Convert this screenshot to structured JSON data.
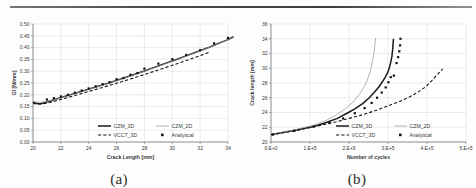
{
  "figure": {
    "subfigure_labels": [
      "(a)",
      "(b)"
    ]
  },
  "legend": {
    "entries": [
      {
        "label": "CZM_3D",
        "style": "solid-bold"
      },
      {
        "label": "CZM_2D",
        "style": "solid-thin-gray"
      },
      {
        "label": "VCCT_3D",
        "style": "dashed"
      },
      {
        "label": "Analytical",
        "style": "square-marker"
      }
    ]
  },
  "chart_data": [
    {
      "type": "line",
      "panel": "(a)",
      "title": "",
      "xlabel": "Crack Length [mm]",
      "ylabel": "GI [N/mm]",
      "xlim": [
        20,
        34
      ],
      "ylim": [
        0.0,
        0.5
      ],
      "xticks": [
        20,
        22,
        24,
        26,
        28,
        30,
        32,
        34
      ],
      "yticks": [
        0.0,
        0.05,
        0.1,
        0.15,
        0.2,
        0.25,
        0.3,
        0.35,
        0.4,
        0.45,
        0.5
      ],
      "ytick_labels": [
        "0.00",
        "0.05",
        "0.10",
        "0.15",
        "0.20",
        "0.25",
        "0.30",
        "0.35",
        "0.40",
        "0.45",
        "0.50"
      ],
      "xtick_labels": [
        "20",
        "22",
        "24",
        "26",
        "28",
        "30",
        "32",
        "34"
      ],
      "grid": true,
      "legend_position": "inside-bottom-right",
      "series": [
        {
          "name": "CZM_3D",
          "x": [
            20.0,
            20.2,
            20.4,
            20.6,
            20.8,
            21.0,
            21.3,
            21.6,
            22.0,
            22.5,
            23.0,
            23.5,
            24.0,
            24.5,
            25.0,
            25.5,
            26.0,
            26.5,
            27.0,
            27.5,
            28.0,
            28.5,
            29.0,
            29.5,
            30.0,
            30.5,
            31.0,
            31.5,
            32.0,
            32.5,
            33.0,
            33.5,
            34.0,
            34.4
          ],
          "y": [
            0.17,
            0.164,
            0.162,
            0.163,
            0.166,
            0.17,
            0.175,
            0.181,
            0.188,
            0.197,
            0.206,
            0.215,
            0.224,
            0.233,
            0.242,
            0.251,
            0.261,
            0.271,
            0.281,
            0.291,
            0.301,
            0.312,
            0.322,
            0.333,
            0.343,
            0.354,
            0.365,
            0.376,
            0.387,
            0.398,
            0.41,
            0.422,
            0.434,
            0.446
          ]
        },
        {
          "name": "CZM_2D",
          "x": [
            20.0,
            20.5,
            21.0,
            21.5,
            22.0,
            23.0,
            24.0,
            25.0,
            26.0,
            27.0,
            28.0,
            29.0,
            30.0,
            31.0,
            32.0,
            33.0,
            34.0,
            34.4
          ],
          "y": [
            0.172,
            0.168,
            0.172,
            0.179,
            0.187,
            0.205,
            0.223,
            0.241,
            0.26,
            0.28,
            0.3,
            0.321,
            0.342,
            0.364,
            0.386,
            0.409,
            0.433,
            0.444
          ]
        },
        {
          "name": "VCCT_3D",
          "x": [
            20.0,
            20.5,
            21.0,
            21.5,
            22.0,
            23.0,
            24.0,
            25.0,
            26.0,
            27.0,
            28.0,
            29.0,
            30.0,
            31.0,
            32.0,
            32.6
          ],
          "y": [
            0.163,
            0.16,
            0.165,
            0.172,
            0.18,
            0.197,
            0.214,
            0.231,
            0.249,
            0.267,
            0.286,
            0.305,
            0.325,
            0.345,
            0.366,
            0.379
          ]
        },
        {
          "name": "Analytical",
          "marker": "square",
          "x": [
            21.0,
            21.5,
            22.0,
            22.5,
            23.0,
            23.5,
            24.0,
            24.5,
            25.0,
            25.5,
            26.0,
            26.5,
            27.0,
            27.5,
            28.0,
            29.0,
            30.0,
            31.0,
            32.0,
            33.0,
            34.0
          ],
          "y": [
            0.18,
            0.186,
            0.193,
            0.2,
            0.209,
            0.218,
            0.227,
            0.236,
            0.245,
            0.253,
            0.266,
            0.271,
            0.285,
            0.292,
            0.311,
            0.332,
            0.351,
            0.369,
            0.389,
            0.418,
            0.441
          ]
        }
      ]
    },
    {
      "type": "line",
      "panel": "(b)",
      "title": "",
      "xlabel": "Number of cycles",
      "ylabel": "Crack length [mm]",
      "xlim": [
        0,
        500000
      ],
      "ylim": [
        20,
        36
      ],
      "xticks": [
        0,
        100000,
        200000,
        300000,
        400000,
        500000
      ],
      "xtick_labels": [
        "0.E+0",
        "1.E+5",
        "2.E+5",
        "3.E+5",
        "4.E+5",
        "5.E+5"
      ],
      "yticks": [
        20,
        22,
        24,
        26,
        28,
        30,
        32,
        34,
        36
      ],
      "ytick_labels": [
        "20",
        "22",
        "24",
        "26",
        "28",
        "30",
        "32",
        "34",
        "36"
      ],
      "grid": true,
      "legend_position": "inside-bottom-right",
      "series": [
        {
          "name": "CZM_3D",
          "x": [
            0,
            20000,
            50000,
            80000,
            110000,
            140000,
            170000,
            195000,
            215000,
            235000,
            252000,
            266000,
            277000,
            286000,
            293000,
            299000,
            303000,
            307000,
            310000,
            312000,
            314000
          ],
          "y": [
            21.0,
            21.2,
            21.5,
            21.8,
            22.1,
            22.6,
            23.2,
            23.9,
            24.5,
            25.2,
            26.0,
            26.8,
            27.5,
            28.2,
            28.8,
            29.4,
            30.0,
            30.8,
            31.6,
            32.6,
            34.0
          ]
        },
        {
          "name": "CZM_2D",
          "x": [
            0,
            20000,
            50000,
            80000,
            110000,
            140000,
            165000,
            188000,
            208000,
            224000,
            237000,
            247000,
            254000,
            259000,
            263000,
            265000,
            267000,
            268000
          ],
          "y": [
            21.0,
            21.2,
            21.5,
            21.9,
            22.3,
            22.9,
            23.6,
            24.4,
            25.3,
            26.3,
            27.3,
            28.4,
            29.5,
            30.6,
            31.8,
            32.6,
            33.4,
            34.1
          ]
        },
        {
          "name": "VCCT_3D",
          "x": [
            0,
            25000,
            60000,
            95000,
            130000,
            165000,
            200000,
            235000,
            270000,
            300000,
            330000,
            355000,
            378000,
            397000,
            412000,
            424000,
            433000,
            440000
          ],
          "y": [
            21.0,
            21.2,
            21.5,
            21.9,
            22.3,
            22.7,
            23.2,
            23.7,
            24.3,
            24.9,
            25.5,
            26.1,
            26.8,
            27.5,
            28.3,
            29.0,
            29.5,
            29.9
          ]
        },
        {
          "name": "Analytical",
          "marker": "square",
          "x": [
            5000,
            60000,
            110000,
            150000,
            185000,
            215000,
            240000,
            258000,
            272000,
            284000,
            294000,
            301000,
            307000,
            315000,
            322000,
            326000,
            329000,
            331000,
            332000
          ],
          "y": [
            21.0,
            21.5,
            22.1,
            22.6,
            23.2,
            23.9,
            24.6,
            25.3,
            26.0,
            26.7,
            27.4,
            28.1,
            28.8,
            29.0,
            30.7,
            31.5,
            32.3,
            33.1,
            34.0
          ]
        }
      ]
    }
  ]
}
